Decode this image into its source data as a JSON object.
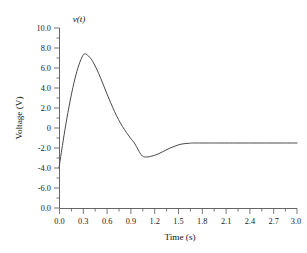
{
  "chart_data": {
    "type": "line",
    "title": "v(t)",
    "xlabel": "Time (s)",
    "ylabel": "Voltage (V)",
    "xlim": [
      0.0,
      3.0
    ],
    "ylim": [
      -8.0,
      10.0
    ],
    "grid": false,
    "legend": null,
    "xticks": [
      "0.0",
      "0.3",
      "0.6",
      "0.9",
      "1.2",
      "1.5",
      "1.8",
      "2.1",
      "2.4",
      "2.7",
      "3.0"
    ],
    "xtick_values": [
      0.0,
      0.3,
      0.6,
      0.9,
      1.2,
      1.5,
      1.8,
      2.1,
      2.4,
      2.7,
      3.0
    ],
    "yticks": [
      "10.0",
      "8.0",
      "6.0",
      "4.0",
      "2.0",
      "0",
      "-2.0",
      "-4.0",
      "-6.0",
      "0.0"
    ],
    "ytick_values": [
      10.0,
      8.0,
      6.0,
      4.0,
      2.0,
      0.0,
      -2.0,
      -4.0,
      -6.0,
      -8.0
    ],
    "series": [
      {
        "name": "v(t)",
        "color": "#4a4a4a",
        "x": [
          0.0,
          0.05,
          0.1,
          0.15,
          0.2,
          0.25,
          0.3,
          0.32,
          0.35,
          0.4,
          0.45,
          0.5,
          0.55,
          0.6,
          0.65,
          0.7,
          0.75,
          0.8,
          0.85,
          0.9,
          0.95,
          1.0,
          1.05,
          1.1,
          1.15,
          1.2,
          1.25,
          1.3,
          1.35,
          1.4,
          1.45,
          1.5,
          1.55,
          1.6,
          1.65,
          1.7,
          1.8,
          1.9,
          2.0,
          2.2,
          2.4,
          2.6,
          2.8,
          3.0
        ],
        "y": [
          -4.0,
          -1.4,
          1.0,
          3.1,
          4.9,
          6.3,
          7.25,
          7.4,
          7.35,
          6.95,
          6.3,
          5.45,
          4.5,
          3.5,
          2.55,
          1.65,
          0.85,
          0.15,
          -0.45,
          -1.0,
          -1.5,
          -2.2,
          -2.8,
          -2.9,
          -2.85,
          -2.75,
          -2.6,
          -2.4,
          -2.2,
          -2.0,
          -1.85,
          -1.7,
          -1.6,
          -1.55,
          -1.52,
          -1.5,
          -1.5,
          -1.5,
          -1.5,
          -1.5,
          -1.5,
          -1.5,
          -1.5,
          -1.5
        ]
      }
    ],
    "annotations": {
      "peak_value": 7.4,
      "peak_time": 0.32,
      "trough_value": -2.9,
      "trough_time": 1.1,
      "initial_value": -4.0,
      "steady_state_value": -1.5
    }
  },
  "axis_geometry": {
    "plot_left_px": 59,
    "plot_right_px": 297,
    "plot_top_px": 28,
    "plot_bottom_px": 208
  }
}
